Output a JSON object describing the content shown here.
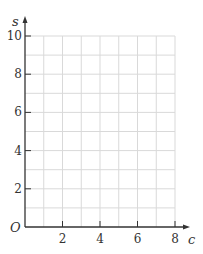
{
  "chart_data": {
    "type": "line",
    "title": "",
    "xlabel": "c",
    "ylabel": "s",
    "origin_label": "O",
    "xlim": [
      0,
      8
    ],
    "ylim": [
      0,
      10
    ],
    "x_ticks": [
      2,
      4,
      6,
      8
    ],
    "y_ticks": [
      2,
      4,
      6,
      8,
      10
    ],
    "x_tick_labels": [
      "2",
      "4",
      "6",
      "8"
    ],
    "y_tick_labels": [
      "2",
      "4",
      "6",
      "8",
      "10"
    ],
    "grid": true,
    "grid_x_step": 1,
    "grid_y_step": 1,
    "series": [],
    "colors": {
      "axis": "#333333",
      "grid": "#d9d9d9",
      "text": "#333333"
    }
  }
}
